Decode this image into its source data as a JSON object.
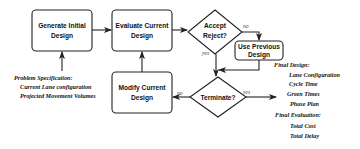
{
  "nodes": {
    "generate": {
      "line1": "Generate Initial",
      "line2": "Design"
    },
    "evaluate": {
      "line1": "Evaluate Current",
      "line2": "Design"
    },
    "accept": {
      "line1": "Accept",
      "line2": "Reject?"
    },
    "use_previous": {
      "line1": "Use Previous",
      "line2": "Design"
    },
    "modify": {
      "line1": "Modify Current",
      "line2": "Design"
    },
    "terminate": {
      "line1": "Terminate?"
    }
  },
  "edge_labels": {
    "accept_no": "no",
    "accept_yes": "yes",
    "terminate_no": "no",
    "terminate_yes": "yes"
  },
  "problem_spec": {
    "title": "Problem Specification:",
    "items": [
      "Current Lane configuration",
      "Projected Movement Volumes"
    ]
  },
  "final_design": {
    "title": "Final Design:",
    "items": [
      "Lane Configuration",
      "Cycle Time",
      "Green Times",
      "Phase Plan"
    ]
  },
  "final_evaluation": {
    "title": "Final Evaluation:",
    "items": [
      "Total Cost",
      "Total Delay"
    ]
  }
}
